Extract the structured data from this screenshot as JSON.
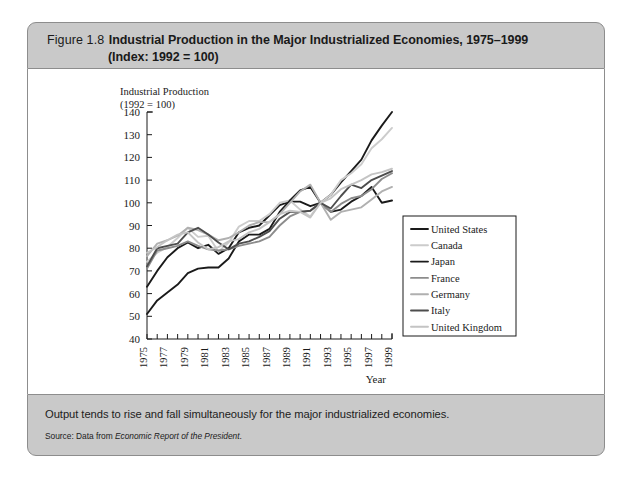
{
  "figure": {
    "number": "Figure 1.8",
    "title": "Industrial Production in the Major Industrialized Economies, 1975–1999",
    "subtitle": "(Index: 1992 = 100)"
  },
  "footer": {
    "caption": "Output tends to rise and fall simultaneously for the major industrialized economies.",
    "source_prefix": "Source: Data from ",
    "source_italic": "Economic Report of the President",
    "source_suffix": "."
  },
  "chart_data": {
    "type": "line",
    "title": "Industrial Production in the Major Industrialized Economies, 1975–1999",
    "ylabel_line1": "Industrial Production",
    "ylabel_line2": "(1992 = 100)",
    "xlabel": "Year",
    "ylim": [
      40,
      140
    ],
    "yticks": [
      40,
      50,
      60,
      70,
      80,
      90,
      100,
      110,
      120,
      130,
      140
    ],
    "xlim": [
      1975,
      1999
    ],
    "xticks": [
      1975,
      1977,
      1979,
      1981,
      1983,
      1985,
      1987,
      1989,
      1991,
      1993,
      1995,
      1997,
      1999
    ],
    "xtick_labels": [
      "1975",
      "1977",
      "1979",
      "1981",
      "1983",
      "1985",
      "1987",
      "1989",
      "1991",
      "1993",
      "1995",
      "1997",
      "1999"
    ],
    "grid": false,
    "legend_position": "inside-lower-right",
    "x": [
      1975,
      1976,
      1977,
      1978,
      1979,
      1980,
      1981,
      1982,
      1983,
      1984,
      1985,
      1986,
      1987,
      1988,
      1989,
      1990,
      1991,
      1992,
      1993,
      1994,
      1995,
      1996,
      1997,
      1998,
      1999
    ],
    "series": [
      {
        "name": "United States",
        "color": "#1a1a1a",
        "width": 1.9,
        "values": [
          63,
          70,
          76,
          80,
          82.5,
          80,
          81.5,
          77.5,
          80,
          87,
          89,
          90,
          94.5,
          99,
          100.5,
          100.5,
          98.5,
          100,
          103.5,
          109,
          114,
          119,
          127.5,
          134,
          140
        ]
      },
      {
        "name": "Canada",
        "color": "#cccccc",
        "width": 1.9,
        "values": [
          74,
          78,
          80.5,
          84.5,
          89,
          85,
          85.5,
          78.5,
          82.5,
          89.5,
          92,
          92,
          95,
          100,
          101,
          97,
          94,
          100,
          103.5,
          110,
          113,
          117,
          124,
          128,
          133
        ]
      },
      {
        "name": "Japan",
        "color": "#1a1a1a",
        "width": 1.9,
        "values": [
          51,
          57,
          60.5,
          64,
          69,
          71,
          71.5,
          71.5,
          75.5,
          83,
          86,
          86,
          88.5,
          96,
          101,
          105.5,
          107,
          100,
          96,
          97,
          100.5,
          103,
          107,
          100,
          101
        ]
      },
      {
        "name": "France",
        "color": "#8c8c8c",
        "width": 1.9,
        "values": [
          71,
          79,
          80,
          81,
          83,
          81,
          79.5,
          79,
          79.5,
          81,
          82,
          83,
          85,
          90,
          94,
          96,
          96.5,
          100,
          96,
          99.5,
          102,
          103,
          106,
          110.5,
          113
        ]
      },
      {
        "name": "Germany",
        "color": "#b0b0b0",
        "width": 1.9,
        "values": [
          76.5,
          82,
          83.5,
          85.5,
          89,
          88,
          86,
          83.5,
          84.5,
          87,
          90,
          91.5,
          91.5,
          95,
          100,
          105,
          108,
          100,
          92.5,
          96,
          97,
          98,
          101.5,
          105,
          107
        ]
      },
      {
        "name": "Italy",
        "color": "#4d4d4d",
        "width": 1.9,
        "values": [
          72,
          80,
          81,
          82,
          87,
          89,
          86,
          82.5,
          79.5,
          82,
          83,
          85,
          87.5,
          93,
          96,
          96,
          96.5,
          100,
          97.5,
          103,
          108,
          106.5,
          110,
          112,
          114
        ]
      },
      {
        "name": "United Kingdom",
        "color": "#c4c4c4",
        "width": 1.9,
        "values": [
          78,
          80.5,
          83.5,
          86,
          87,
          82.5,
          79.5,
          80.5,
          83,
          84,
          87,
          88.5,
          91.5,
          95,
          96.5,
          96,
          93.5,
          100,
          102,
          106,
          108,
          110,
          112.5,
          113.5,
          115
        ]
      }
    ]
  },
  "axis_label_text": {
    "industrial_production": "Industrial Production",
    "index_note": "(1992 = 100)",
    "year": "Year"
  }
}
